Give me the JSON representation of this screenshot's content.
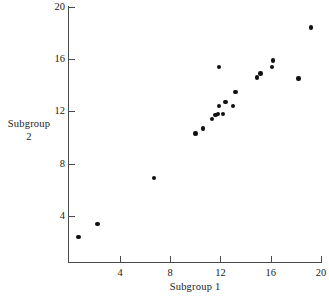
{
  "chart_data": {
    "type": "scatter",
    "title": "",
    "xlabel": "Subgroup 1",
    "ylabel_line1": "Subgroup",
    "ylabel_line2": "2",
    "xlim": [
      0.1,
      20.1
    ],
    "ylim": [
      1.8,
      20.0
    ],
    "xticks": [
      4,
      8,
      12,
      16,
      20
    ],
    "yticks": [
      4,
      8,
      12,
      16,
      20
    ],
    "xticklabels": [
      "4",
      "8",
      "12",
      "16",
      "20"
    ],
    "yticklabels": [
      "4",
      "8",
      "12",
      "16",
      "20"
    ],
    "grid": false,
    "legend": false,
    "marker": "filled-circle",
    "marker_color": "#111111",
    "axis_color": "#4a4a4a",
    "background": "#ffffff",
    "points": [
      {
        "x": 0.7,
        "y": 2.4
      },
      {
        "x": 2.2,
        "y": 3.4
      },
      {
        "x": 6.7,
        "y": 6.9
      },
      {
        "x": 10.0,
        "y": 10.3
      },
      {
        "x": 10.6,
        "y": 10.7
      },
      {
        "x": 11.3,
        "y": 11.4
      },
      {
        "x": 11.6,
        "y": 11.7
      },
      {
        "x": 11.8,
        "y": 11.8
      },
      {
        "x": 11.9,
        "y": 12.4
      },
      {
        "x": 11.9,
        "y": 15.4
      },
      {
        "x": 12.2,
        "y": 11.8
      },
      {
        "x": 12.4,
        "y": 12.7
      },
      {
        "x": 13.0,
        "y": 12.4
      },
      {
        "x": 13.2,
        "y": 13.5
      },
      {
        "x": 14.9,
        "y": 14.6
      },
      {
        "x": 15.2,
        "y": 14.9
      },
      {
        "x": 16.1,
        "y": 15.4
      },
      {
        "x": 16.2,
        "y": 15.9
      },
      {
        "x": 18.2,
        "y": 14.5
      },
      {
        "x": 19.2,
        "y": 18.4
      }
    ]
  },
  "axis_geometry": {
    "x_pixel_at_4": 120,
    "x_pixels_per_unit": 12.56,
    "y_pixel_at_20": 6.7,
    "y_pixels_per_unit": 13.08
  }
}
